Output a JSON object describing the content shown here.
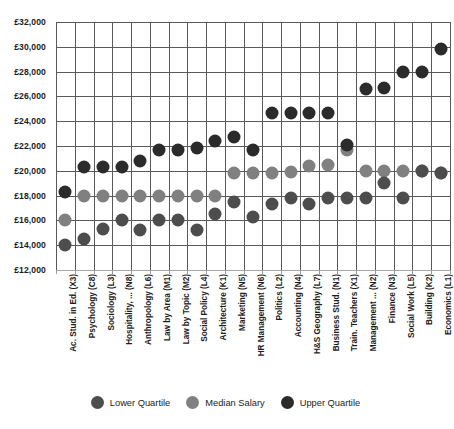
{
  "chart_data": {
    "type": "scatter",
    "title": "",
    "subtitle": "",
    "xlabel": "",
    "ylabel": "",
    "ylim": [
      12000,
      32000
    ],
    "ytick_step": 2000,
    "grid": true,
    "legend_position": "bottom",
    "ytick_labels": [
      "£32,000",
      "£30,000",
      "£28,000",
      "£26,000",
      "£24,000",
      "£22,000",
      "£20,000",
      "£18,000",
      "£16,000",
      "£14,000",
      "£12,000"
    ],
    "ytick_values": [
      32000,
      30000,
      28000,
      26000,
      24000,
      22000,
      20000,
      18000,
      16000,
      14000,
      12000
    ],
    "categories": [
      "Ac. Stud. in Ed. (X3)",
      "Psychology (C8)",
      "Sociology (L3)",
      "Hospitality, ... (N8)",
      "Anthropology (L6)",
      "Law by Area (M1)",
      "Law by Topic (M2)",
      "Social Policy (L4)",
      "Architecture (K1)",
      "Marketing (N5)",
      "HR Management (N6)",
      "Politics (L2)",
      "Accounting (N4)",
      "H&S Geography (L7)",
      "Business Stud. (N1)",
      "Train. Teachers (X1)",
      "Management ... (N2)",
      "Finance (N3)",
      "Social Work (L5)",
      "Building (K2)",
      "Economics (L1)"
    ],
    "series": [
      {
        "name": "Lower Quartile",
        "color": "#4d4d4d",
        "values": [
          14000,
          14500,
          15300,
          16000,
          15200,
          16000,
          16000,
          15200,
          16500,
          17500,
          16300,
          17300,
          17800,
          17300,
          17800,
          17800,
          17800,
          19000,
          17800,
          20000,
          19800
        ]
      },
      {
        "name": "Median Salary",
        "color": "#808080",
        "values": [
          16000,
          18000,
          18000,
          18000,
          18000,
          18000,
          18000,
          18000,
          18000,
          19800,
          19800,
          19800,
          19900,
          20400,
          20500,
          21700,
          20000,
          20000,
          20000,
          20000,
          19800
        ]
      },
      {
        "name": "Upper Quartile",
        "color": "#2b2b2b",
        "values": [
          18300,
          20300,
          20300,
          20300,
          20800,
          21700,
          21700,
          21800,
          22400,
          22700,
          21700,
          24700,
          24700,
          24700,
          24700,
          22100,
          26600,
          26700,
          28000,
          28000,
          29800
        ]
      }
    ]
  },
  "legend": {
    "items": [
      {
        "label": "Lower Quartile",
        "color": "#4d4d4d",
        "icon": "circle-marker-icon"
      },
      {
        "label": "Median Salary",
        "color": "#808080",
        "icon": "circle-marker-icon"
      },
      {
        "label": "Upper Quartile",
        "color": "#2b2b2b",
        "icon": "circle-marker-icon"
      }
    ]
  }
}
